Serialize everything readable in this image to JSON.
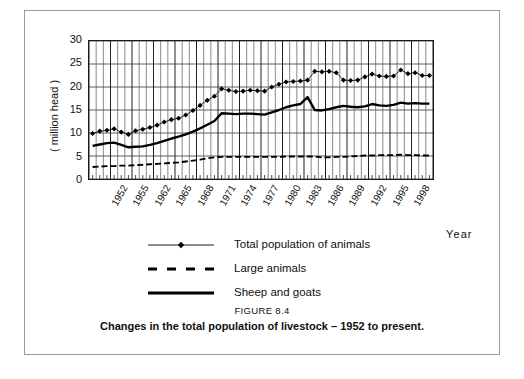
{
  "figure": {
    "caption_label": "FIGURE 8.4",
    "caption_text": "Changes in the total population of livestock – 1952 to present."
  },
  "axes": {
    "y_title": "( million head )",
    "x_title": "Year",
    "y_ticks": [
      "30",
      "25",
      "20",
      "15",
      "10",
      "5",
      "0"
    ],
    "x_tick_labels": [
      "1952",
      "1955",
      "1962",
      "1965",
      "1968",
      "1971",
      "1974",
      "1977",
      "1980",
      "1983",
      "1986",
      "1989",
      "1992",
      "1995",
      "1998"
    ]
  },
  "legend": {
    "items": [
      {
        "label": "Total population of animals",
        "style": "line-marker-diamond",
        "color": "#000000"
      },
      {
        "label": "Large animals",
        "style": "dashed-line",
        "color": "#000000"
      },
      {
        "label": "Sheep and goats",
        "style": "thick-solid-line",
        "color": "#000000"
      }
    ]
  },
  "chart_data": {
    "type": "line",
    "title": "Changes in the total population of livestock – 1952 to present.",
    "xlabel": "Year",
    "ylabel": "( million head )",
    "ylim": [
      0,
      30
    ],
    "ytick_step": 5,
    "grid": true,
    "legend_position": "below-plot",
    "x": [
      1952,
      1953,
      1954,
      1955,
      1956,
      1957,
      1958,
      1959,
      1960,
      1961,
      1962,
      1963,
      1964,
      1965,
      1966,
      1967,
      1968,
      1969,
      1970,
      1971,
      1972,
      1973,
      1974,
      1975,
      1976,
      1977,
      1978,
      1979,
      1980,
      1981,
      1982,
      1983,
      1984,
      1985,
      1986,
      1987,
      1988,
      1989,
      1990,
      1991,
      1992,
      1993,
      1994,
      1995,
      1996,
      1997,
      1998,
      1999
    ],
    "x_tick_labels": [
      "1952",
      "1955",
      "1962",
      "1965",
      "1968",
      "1971",
      "1974",
      "1977",
      "1980",
      "1983",
      "1986",
      "1989",
      "1992",
      "1995",
      "1998"
    ],
    "series": [
      {
        "name": "Total population of animals",
        "marker": "diamond",
        "line": "thin-solid",
        "color": "#000000",
        "values": [
          9.9,
          10.4,
          10.6,
          10.9,
          10.2,
          9.7,
          10.5,
          10.8,
          11.2,
          11.7,
          12.4,
          12.9,
          13.2,
          13.9,
          14.9,
          16.0,
          17.1,
          18.0,
          19.6,
          19.3,
          19.0,
          19.1,
          19.3,
          19.2,
          19.1,
          20.0,
          20.6,
          21.1,
          21.2,
          21.3,
          21.5,
          23.4,
          23.3,
          23.4,
          23.1,
          21.5,
          21.4,
          21.5,
          22.2,
          22.8,
          22.4,
          22.3,
          22.4,
          23.7,
          22.9,
          23.1,
          22.5,
          22.5
        ]
      },
      {
        "name": "Large animals",
        "marker": "none",
        "line": "dashed",
        "color": "#000000",
        "values": [
          2.6,
          2.7,
          2.8,
          2.8,
          2.9,
          2.9,
          3.0,
          3.1,
          3.2,
          3.3,
          3.4,
          3.5,
          3.6,
          3.8,
          4.0,
          4.2,
          4.5,
          4.7,
          4.8,
          4.8,
          4.8,
          4.8,
          4.8,
          4.8,
          4.8,
          4.8,
          4.8,
          4.9,
          4.9,
          4.9,
          4.9,
          4.9,
          4.7,
          4.7,
          4.8,
          4.8,
          4.9,
          5.0,
          5.1,
          5.1,
          5.2,
          5.2,
          5.2,
          5.3,
          5.2,
          5.2,
          5.1,
          5.1
        ]
      },
      {
        "name": "Sheep and goats",
        "marker": "none",
        "line": "thick-solid",
        "color": "#000000",
        "values": [
          7.2,
          7.5,
          7.8,
          7.9,
          7.4,
          6.9,
          7.0,
          7.1,
          7.4,
          7.8,
          8.3,
          8.8,
          9.2,
          9.7,
          10.3,
          11.0,
          11.8,
          12.6,
          14.3,
          14.2,
          14.1,
          14.2,
          14.2,
          14.1,
          14.0,
          14.5,
          15.0,
          15.6,
          16.0,
          16.3,
          17.8,
          15.0,
          14.9,
          15.2,
          15.6,
          15.9,
          15.7,
          15.6,
          15.8,
          16.3,
          16.0,
          15.9,
          16.1,
          16.6,
          16.4,
          16.5,
          16.4,
          16.4
        ]
      }
    ]
  }
}
